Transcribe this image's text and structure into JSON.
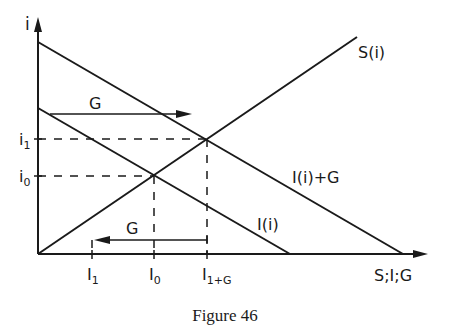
{
  "figure": {
    "caption": "Figure 46",
    "y_axis_label": "i",
    "x_axis_label": "S;I;G",
    "y_ticks": [
      {
        "label": "i",
        "sub": "1",
        "name": "i1"
      },
      {
        "label": "i",
        "sub": "0",
        "name": "i0"
      }
    ],
    "x_ticks": [
      {
        "label": "I",
        "sub": "1",
        "name": "I1"
      },
      {
        "label": "I",
        "sub": "0",
        "name": "I0"
      },
      {
        "label": "I",
        "sub": "1+G",
        "name": "I1+G"
      }
    ],
    "curves": {
      "saving": "S(i)",
      "investment": "I(i)",
      "investment_plus_g": "I(i)+G"
    },
    "arrows": {
      "upper_shift": "G",
      "lower_shift": "G"
    },
    "colors": {
      "ink": "#1a1a1a",
      "background": "#ffffff"
    }
  }
}
